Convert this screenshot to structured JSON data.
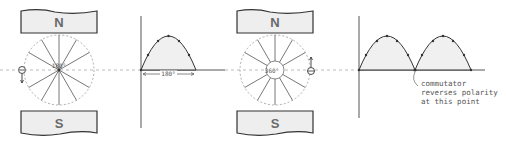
{
  "diagram": {
    "panel_left": {
      "magnet_top": {
        "label": "N"
      },
      "magnet_bottom": {
        "label": "S"
      },
      "rotor_angle_label": "180°",
      "graph": {
        "dimension_label": "180°",
        "humps": 1
      }
    },
    "panel_right": {
      "magnet_top": {
        "label": "N"
      },
      "magnet_bottom": {
        "label": "S"
      },
      "rotor_angle_label": "360°",
      "graph": {
        "humps": 2
      }
    },
    "annotation": {
      "lines": [
        "commutator",
        "reverses polarity",
        "at this point"
      ]
    },
    "colors": {
      "magnet_fill": "#eeeeee",
      "stroke": "#333333",
      "wave_fill": "#f0f0f0",
      "dashed": "#aaaaaa"
    }
  }
}
